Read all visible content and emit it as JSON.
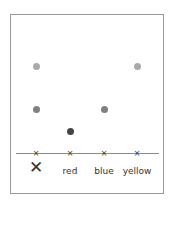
{
  "diagram": {
    "type": "paper-chromatography",
    "baseline_marker": "×",
    "lanes": [
      {
        "label": "✕",
        "x": 36,
        "spots": [
          {
            "y": 66,
            "color": "#aaaaaa"
          },
          {
            "y": 109,
            "color": "#808080"
          }
        ]
      },
      {
        "label": "red",
        "x": 70,
        "spots": [
          {
            "y": 131,
            "color": "#444444"
          }
        ]
      },
      {
        "label": "blue",
        "x": 104,
        "spots": [
          {
            "y": 109,
            "color": "#808080"
          }
        ]
      },
      {
        "label": "yellow",
        "x": 137,
        "spots": [
          {
            "y": 66,
            "color": "#aaaaaa"
          }
        ]
      }
    ]
  }
}
